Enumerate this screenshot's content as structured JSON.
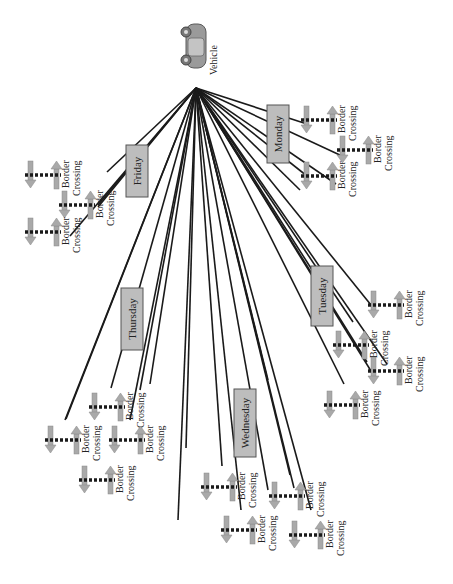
{
  "diagram": {
    "type": "tree",
    "orientation": "rotated-90",
    "colors": {
      "background": "#ffffff",
      "line": "#1a1a1a",
      "day_box_fill": "#bdbdbd",
      "day_box_stroke": "#555555",
      "arrow_fill": "#a9a9a9",
      "dash": "#1a1a1a"
    },
    "root": {
      "label": "Vehicle",
      "icon": "car-icon",
      "x": 196,
      "y": 88
    },
    "days": [
      {
        "label": "Friday",
        "box": {
          "x": 126,
          "y": 145,
          "w": 22,
          "h": 52
        },
        "crossings": [
          {
            "label1": "Border",
            "label2": "Crossing",
            "x": 28,
            "y": 175,
            "end": [
              107,
              172
            ]
          },
          {
            "label1": "Border",
            "label2": "Crossing",
            "x": 62,
            "y": 205,
            "end": [
              98,
              205
            ]
          },
          {
            "label1": "Border",
            "label2": "Crossing",
            "x": 28,
            "y": 232,
            "end": [
              70,
              236
            ]
          }
        ]
      },
      {
        "label": "Monday",
        "box": {
          "x": 267,
          "y": 105,
          "w": 22,
          "h": 58
        },
        "crossings": [
          {
            "label1": "Border",
            "label2": "Crossing",
            "x": 304,
            "y": 120,
            "end": [
              307,
              124
            ]
          },
          {
            "label1": "Border",
            "label2": "Crossing",
            "x": 340,
            "y": 150,
            "end": [
              342,
              156
            ]
          },
          {
            "label1": "Border",
            "label2": "Crossing",
            "x": 304,
            "y": 176,
            "end": [
              307,
              176
            ]
          }
        ]
      },
      {
        "label": "Thursday",
        "box": {
          "x": 121,
          "y": 288,
          "w": 22,
          "h": 62
        },
        "crossings": [
          {
            "label1": "Border",
            "label2": "Crossing",
            "x": 92,
            "y": 407,
            "end": [
              111,
              388
            ]
          },
          {
            "label1": "Border",
            "label2": "Crossing",
            "x": 48,
            "y": 440,
            "end": [
              65,
              420
            ]
          },
          {
            "label1": "Border",
            "label2": "Crossing",
            "x": 112,
            "y": 440,
            "end": [
              130,
              420
            ]
          },
          {
            "label1": "Border",
            "label2": "Crossing",
            "x": 82,
            "y": 480,
            "end": [
              0,
              0
            ]
          }
        ]
      },
      {
        "label": "Tuesday",
        "box": {
          "x": 311,
          "y": 266,
          "w": 22,
          "h": 60
        },
        "crossings": [
          {
            "label1": "Border",
            "label2": "Crossing",
            "x": 371,
            "y": 305,
            "end": [
              371,
              305
            ]
          },
          {
            "label1": "Border",
            "label2": "Crossing",
            "x": 336,
            "y": 345,
            "end": [
              353,
              322
            ]
          },
          {
            "label1": "Border",
            "label2": "Crossing",
            "x": 371,
            "y": 371,
            "end": [
              371,
              371
            ]
          },
          {
            "label1": "Border",
            "label2": "Crossing",
            "x": 327,
            "y": 405,
            "end": [
              344,
              384
            ]
          }
        ]
      },
      {
        "label": "Wednesday",
        "box": {
          "x": 234,
          "y": 389,
          "w": 22,
          "h": 68
        },
        "crossings": [
          {
            "label1": "Border",
            "label2": "Crossing",
            "x": 204,
            "y": 487,
            "end": [
              222,
              466
            ]
          },
          {
            "label1": "Border",
            "label2": "Crossing",
            "x": 224,
            "y": 530,
            "end": [
              241,
              510
            ]
          },
          {
            "label1": "Border",
            "label2": "Crossing",
            "x": 272,
            "y": 496,
            "end": [
              290,
              475
            ]
          },
          {
            "label1": "Border",
            "label2": "Crossing",
            "x": 292,
            "y": 535,
            "end": [
              311,
              510
            ]
          }
        ]
      }
    ]
  }
}
